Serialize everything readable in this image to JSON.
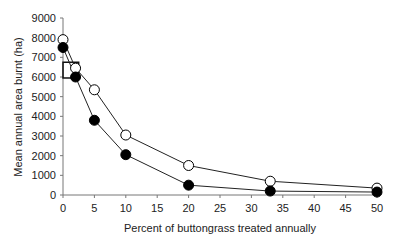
{
  "chart_data": {
    "type": "line",
    "title": "",
    "xlabel": "Percent of buttongrass treated annually",
    "ylabel": "Mean annual area burnt (ha)",
    "xlim": [
      0,
      50
    ],
    "ylim": [
      0,
      9000
    ],
    "xticks": [
      0,
      5,
      10,
      15,
      20,
      25,
      30,
      35,
      40,
      45,
      50
    ],
    "yticks": [
      0,
      1000,
      2000,
      3000,
      4000,
      5000,
      6000,
      7000,
      8000,
      9000
    ],
    "grid": false,
    "legend": null,
    "series": [
      {
        "name": "open circles",
        "marker": "open-circle",
        "x": [
          0,
          2,
          5,
          10,
          20,
          33,
          50
        ],
        "values": [
          7900,
          6450,
          5350,
          3050,
          1500,
          700,
          350
        ]
      },
      {
        "name": "filled circles",
        "marker": "filled-circle",
        "x": [
          0,
          2,
          5,
          10,
          20,
          33,
          50
        ],
        "values": [
          7500,
          6000,
          3800,
          2050,
          500,
          200,
          150
        ]
      }
    ],
    "annotations": [
      {
        "type": "square",
        "x": [
          0,
          2.5
        ],
        "y": [
          5950,
          6750
        ]
      }
    ]
  }
}
